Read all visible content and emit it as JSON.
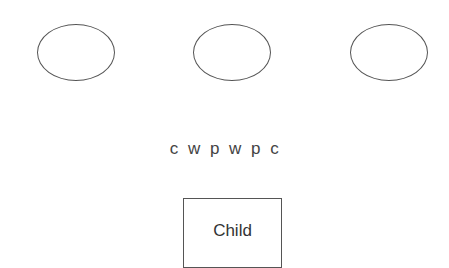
{
  "diagram": {
    "nodes": [
      {
        "id": "ellipse-1",
        "shape": "ellipse",
        "label": ""
      },
      {
        "id": "ellipse-2",
        "shape": "ellipse",
        "label": ""
      },
      {
        "id": "ellipse-3",
        "shape": "ellipse",
        "label": ""
      }
    ],
    "middle_text": "c w p w p c",
    "child": {
      "label": "Child"
    }
  }
}
